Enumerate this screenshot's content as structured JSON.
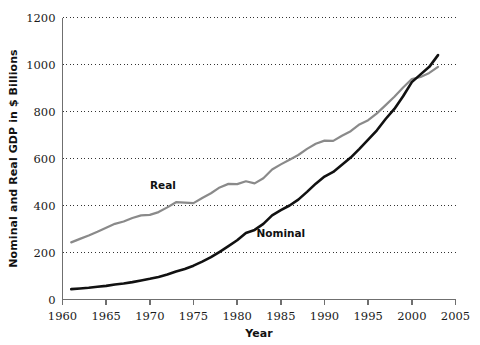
{
  "chart_data": {
    "type": "line",
    "title": "",
    "xlabel": "Year",
    "ylabel": "Nominal and Real GDP in $ Billions",
    "xlim": [
      1960,
      2005
    ],
    "ylim": [
      0,
      1200
    ],
    "xticks": [
      1960,
      1965,
      1970,
      1975,
      1980,
      1985,
      1990,
      1995,
      2000,
      2005
    ],
    "yticks": [
      0,
      200,
      400,
      600,
      800,
      1000,
      1200
    ],
    "grid": "horizontal-dotted",
    "legend": "inline-annotations",
    "annotations": [
      {
        "text": "Real",
        "x": 1971.5,
        "y": 470
      },
      {
        "text": "Nominal",
        "x": 1985.0,
        "y": 268
      }
    ],
    "colors": {
      "nominal": "#111111",
      "real": "#8a8a8a",
      "axis": "#6f6f6f",
      "grid": "#333333"
    },
    "x": [
      1961,
      1962,
      1963,
      1964,
      1965,
      1966,
      1967,
      1968,
      1969,
      1970,
      1971,
      1972,
      1973,
      1974,
      1975,
      1976,
      1977,
      1978,
      1979,
      1980,
      1981,
      1982,
      1983,
      1984,
      1985,
      1986,
      1987,
      1988,
      1989,
      1990,
      1991,
      1992,
      1993,
      1994,
      1995,
      1996,
      1997,
      1998,
      1999,
      2000,
      2001,
      2002,
      2003
    ],
    "series": [
      {
        "name": "Real",
        "color": "#8a8a8a",
        "values": [
          243,
          258,
          272,
          288,
          305,
          322,
          332,
          347,
          358,
          360,
          372,
          392,
          414,
          412,
          410,
          432,
          452,
          477,
          492,
          491,
          503,
          494,
          516,
          553,
          575,
          595,
          615,
          641,
          663,
          676,
          675,
          697,
          716,
          745,
          763,
          792,
          827,
          863,
          902,
          938,
          947,
          964,
          990
        ]
      },
      {
        "name": "Nominal",
        "color": "#111111",
        "values": [
          44,
          47,
          50,
          54,
          58,
          64,
          68,
          74,
          81,
          88,
          96,
          106,
          119,
          130,
          144,
          161,
          180,
          203,
          227,
          252,
          283,
          296,
          322,
          358,
          380,
          400,
          425,
          458,
          493,
          523,
          543,
          573,
          604,
          641,
          680,
          720,
          768,
          811,
          865,
          925,
          958,
          990,
          1040
        ]
      }
    ]
  },
  "axis": {
    "y_title": "Nominal and Real GDP in $ Billions",
    "x_title": "Year",
    "y_tick_labels": [
      "1200",
      "1000",
      "800",
      "600",
      "400",
      "200",
      "0"
    ],
    "x_tick_labels": [
      "1960",
      "1965",
      "1970",
      "1975",
      "1980",
      "1985",
      "1990",
      "1995",
      "2000",
      "2005"
    ]
  },
  "labels": {
    "real": "Real",
    "nominal": "Nominal"
  }
}
